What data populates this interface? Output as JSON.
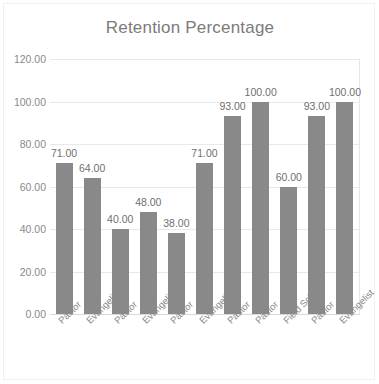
{
  "chart_data": {
    "type": "bar",
    "title": "Retention Percentage",
    "xlabel": "",
    "ylabel": "",
    "ylim": [
      0,
      120
    ],
    "ytick_step": 20,
    "yticks": [
      "0.00",
      "20.00",
      "40.00",
      "60.00",
      "80.00",
      "100.00",
      "120.00"
    ],
    "ytick_values": [
      0,
      20,
      40,
      60,
      80,
      100,
      120
    ],
    "grid": true,
    "legend": false,
    "legend_position": "none",
    "categories": [
      "Pastor",
      "Evangelist",
      "Pastor",
      "Evangelist",
      "Pastor",
      "Evangelist",
      "Pastor",
      "Pastor",
      "Field School",
      "Pastor",
      "Evangelist"
    ],
    "values": [
      71,
      64,
      40,
      48,
      38,
      71,
      93,
      100,
      60,
      93,
      100
    ],
    "data_labels": [
      "71.00",
      "64.00",
      "40.00",
      "48.00",
      "38.00",
      "71.00",
      "93.00",
      "100.00",
      "60.00",
      "93.00",
      "100.00"
    ],
    "bar_color": "#898989",
    "gridline_color": "#e9e9e9",
    "title_color": "#7b7b7b",
    "tick_color": "#8a8a8a",
    "data_label_color": "#6f6f6f",
    "plot_border_color": "#e6e6e6",
    "frame_border_color": "#f0f0f0",
    "background_color": "#ffffff",
    "category_label_rotation": -45
  }
}
